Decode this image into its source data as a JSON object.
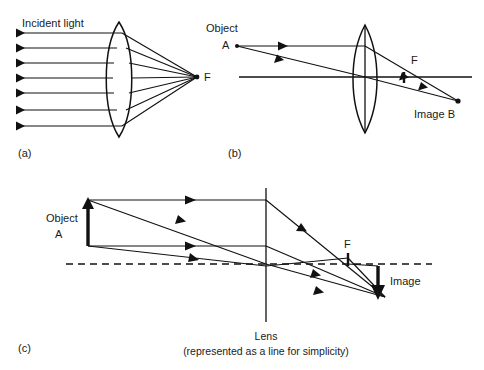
{
  "figure": {
    "background_color": "#ffffff",
    "ink_color": "#111111",
    "panels": [
      {
        "id": "a",
        "panel_label": "(a)",
        "caption": "Incident light",
        "description": "Parallel incident rays converge through a biconvex lens to focal point F",
        "lens_type": "biconvex",
        "ray_count": 7,
        "focus_label": "F"
      },
      {
        "id": "b",
        "panel_label": "(b)",
        "object_label": "Object",
        "object_point": "A",
        "focus_label": "F",
        "focus_label_left": "F",
        "image_label": "Image B",
        "lens_type": "biconvex",
        "ray_count": 2
      },
      {
        "id": "c",
        "panel_label": "(c)",
        "object_label": "Object",
        "object_point": "A",
        "focus_label": "F",
        "image_label": "Image",
        "lens_label": "Lens",
        "lens_sublabel": "(represented as a line for simplicity)",
        "lens_type": "thin-line",
        "ray_count": 3
      }
    ]
  },
  "labels": {
    "incident_light": "Incident light",
    "object": "Object",
    "point_a": "A",
    "focus": "F",
    "image_b": "Image B",
    "image": "Image",
    "lens": "Lens",
    "lens_note": "(represented as a line for simplicity)",
    "panel_a": "(a)",
    "panel_b": "(b)",
    "panel_c": "(c)"
  }
}
